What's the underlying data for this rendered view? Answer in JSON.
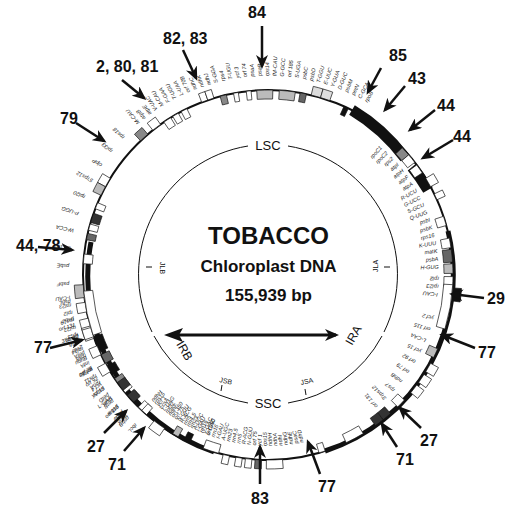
{
  "diagram": {
    "title": "TOBACCO",
    "subtitle": "Chloroplast DNA",
    "size": "155,939 bp",
    "colors": {
      "ink": "#111111",
      "gene_fill_gray": "#b8b8b8",
      "gene_fill_dark": "#666666",
      "gene_fill_black": "#111111",
      "background": "#ffffff"
    },
    "regions": {
      "lsc": "LSC",
      "ssc": "SSC",
      "ira": "IRA",
      "irb": "IRB",
      "jla": "JLA",
      "jlb": "JLB",
      "jsa": "JSA",
      "jsb": "JSB"
    },
    "gene_labels": {
      "top_left": [
        "rbcL",
        "accD",
        "psaI",
        "ycf 4",
        "ycf 10",
        "petA",
        "orf 99",
        "psbJ",
        "psbL",
        "psbF",
        "psbE",
        "orf 103",
        "W-CCA",
        "P-UGG",
        "rpl20",
        "5'rps12",
        "clpP",
        "rpl33",
        "rps18"
      ],
      "top": [
        "M-CAU",
        "atpB",
        "atpE",
        "V-UAC",
        "M-CAU",
        "F-GAA",
        "T-UGU",
        "L-UAA",
        "orf 70B",
        "ndhC",
        "ndhK",
        "ndhJ",
        "S-GGA",
        "rps4",
        "T-UGU",
        "ycf 3",
        "orf 74",
        "psaA",
        "psaB",
        "rps14",
        "fM-CAU",
        "G-GCC",
        "orf 185",
        "S-UGA",
        "psbC",
        "psbD",
        "T-GGU",
        "E-UUC",
        "Y-GUA",
        "D-GUC",
        "psbM",
        "petN",
        "C-GCA",
        "rpoB"
      ],
      "right": [
        "rpoC1",
        "rpoC2",
        "rps2",
        "atpI",
        "atpH",
        "atpF",
        "atpA",
        "R-UCU",
        "G-UCC",
        "S-GCU",
        "Q-UUG",
        "psbI",
        "psbK",
        "rps16",
        "K-UUU",
        "matK",
        "psbA",
        "H-GUG",
        "rpl2",
        "rpl23",
        "I-CAU"
      ],
      "left": [
        "psbB",
        "psbT",
        "psbH",
        "petB",
        "petD",
        "psbN",
        "rpoA",
        "rps11",
        "rpl36",
        "infA",
        "rps8",
        "rpl14",
        "rpl16",
        "rps3",
        "rpl22",
        "rps19",
        "rpl2",
        "rpl23",
        "I-CAU"
      ],
      "ir_right": [
        "ycf 2",
        "orf 115",
        "L-CAA",
        "ycf 15",
        "orf 92",
        "orf 79",
        "ndhB",
        "rps7",
        "3'rps12",
        "orf 131"
      ],
      "ir_left": [
        "ycf 2",
        "orf 115",
        "L-CAA",
        "ycf 15",
        "orf 92",
        "orf 79",
        "ndhB",
        "rps7",
        "3'rps12",
        "orf 131"
      ],
      "bottom_left": [
        "orf 350",
        "V-GAC",
        "rrn16",
        "I-GAU",
        "A-UGC",
        "rrn23",
        "rrn4.5",
        "rrn5",
        "R-ACG",
        "N-GUU",
        "orf 75",
        "orf 350",
        "ndhF",
        "rpl32",
        "L-UAG",
        "ccsA",
        "ycf 1",
        "rps15",
        "ndhH"
      ],
      "bottom": [
        "ndhD",
        "psaC",
        "ndhE",
        "ndhG",
        "ndhI",
        "ndhA",
        "ndhH",
        "rps15",
        "ycf 1",
        "orf 75",
        "N-GUU",
        "R-ACG",
        "rrn5",
        "rrn4.5",
        "rrn23",
        "A-UGC",
        "I-GAU",
        "rrn16",
        "V-GAC"
      ]
    },
    "callouts": [
      {
        "label": "84",
        "x": 248,
        "y": 4,
        "arrow": {
          "x1": 262,
          "y1": 26,
          "x2": 262,
          "y2": 66
        }
      },
      {
        "label": "82, 83",
        "x": 163,
        "y": 30,
        "arrow": {
          "x1": 183,
          "y1": 50,
          "x2": 196,
          "y2": 78
        }
      },
      {
        "label": "2, 80, 81",
        "x": 96,
        "y": 58,
        "arrow": {
          "x1": 122,
          "y1": 80,
          "x2": 144,
          "y2": 98
        }
      },
      {
        "label": "85",
        "x": 389,
        "y": 47,
        "arrow": {
          "x1": 381,
          "y1": 68,
          "x2": 368,
          "y2": 92
        }
      },
      {
        "label": "43",
        "x": 408,
        "y": 70,
        "arrow": {
          "x1": 405,
          "y1": 86,
          "x2": 385,
          "y2": 110
        }
      },
      {
        "label": "44",
        "x": 437,
        "y": 97,
        "arrow": {
          "x1": 435,
          "y1": 110,
          "x2": 410,
          "y2": 130
        }
      },
      {
        "label": "44",
        "x": 453,
        "y": 128,
        "arrow": {
          "x1": 453,
          "y1": 140,
          "x2": 423,
          "y2": 158
        }
      },
      {
        "label": "79",
        "x": 60,
        "y": 110,
        "arrow": {
          "x1": 76,
          "y1": 123,
          "x2": 104,
          "y2": 141
        }
      },
      {
        "label": "44, 78",
        "x": 16,
        "y": 237,
        "arrow": {
          "x1": 38,
          "y1": 247,
          "x2": 72,
          "y2": 250
        }
      },
      {
        "label": "29",
        "x": 487,
        "y": 290,
        "arrow": {
          "x1": 484,
          "y1": 298,
          "x2": 452,
          "y2": 294
        }
      },
      {
        "label": "77",
        "x": 478,
        "y": 344,
        "arrow": {
          "x1": 475,
          "y1": 348,
          "x2": 442,
          "y2": 335
        }
      },
      {
        "label": "77",
        "x": 34,
        "y": 339,
        "arrow": {
          "x1": 50,
          "y1": 348,
          "x2": 82,
          "y2": 340
        }
      },
      {
        "label": "27",
        "x": 87,
        "y": 438,
        "arrow": {
          "x1": 104,
          "y1": 433,
          "x2": 126,
          "y2": 411
        }
      },
      {
        "label": "71",
        "x": 108,
        "y": 456,
        "arrow": {
          "x1": 124,
          "y1": 451,
          "x2": 144,
          "y2": 428
        }
      },
      {
        "label": "27",
        "x": 420,
        "y": 432,
        "arrow": {
          "x1": 421,
          "y1": 428,
          "x2": 400,
          "y2": 408
        }
      },
      {
        "label": "71",
        "x": 396,
        "y": 451,
        "arrow": {
          "x1": 397,
          "y1": 447,
          "x2": 382,
          "y2": 424
        }
      },
      {
        "label": "83",
        "x": 251,
        "y": 490,
        "arrow": {
          "x1": 260,
          "y1": 484,
          "x2": 260,
          "y2": 447
        }
      },
      {
        "label": "77",
        "x": 318,
        "y": 478,
        "arrow": {
          "x1": 320,
          "y1": 474,
          "x2": 308,
          "y2": 442
        }
      }
    ]
  }
}
